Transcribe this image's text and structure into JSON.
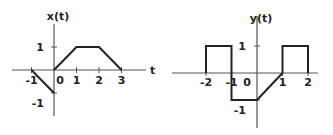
{
  "plots": [
    {
      "id": "x",
      "title": "x(t)",
      "axis_var": "t",
      "x_ticks": [
        {
          "value": -1,
          "label": "-1"
        },
        {
          "value": 0,
          "label": "0"
        },
        {
          "value": 1,
          "label": "1"
        },
        {
          "value": 2,
          "label": "2"
        },
        {
          "value": 3,
          "label": "3"
        }
      ],
      "y_ticks": [
        {
          "value": 1,
          "label": "1"
        },
        {
          "value": -1,
          "label": "-1"
        }
      ],
      "segments": [
        [
          [
            -1,
            0
          ],
          [
            0,
            -1
          ]
        ],
        [
          [
            0,
            0
          ],
          [
            1,
            1
          ],
          [
            2,
            1
          ],
          [
            3,
            0
          ]
        ]
      ]
    },
    {
      "id": "y",
      "title": "y(t)",
      "axis_var": "",
      "x_ticks": [
        {
          "value": -2,
          "label": "-2"
        },
        {
          "value": -1,
          "label": "-1"
        },
        {
          "value": 0,
          "label": "0"
        },
        {
          "value": 1,
          "label": "1"
        },
        {
          "value": 2,
          "label": "2"
        }
      ],
      "y_ticks": [
        {
          "value": 1,
          "label": "1"
        },
        {
          "value": -1,
          "label": "-1"
        }
      ],
      "segments": [
        [
          [
            -2,
            0
          ],
          [
            -2,
            1
          ],
          [
            -1,
            1
          ],
          [
            -1,
            -1
          ],
          [
            0,
            -1
          ],
          [
            1,
            0
          ],
          [
            1,
            1
          ],
          [
            2,
            1
          ],
          [
            2,
            0
          ]
        ]
      ]
    }
  ]
}
